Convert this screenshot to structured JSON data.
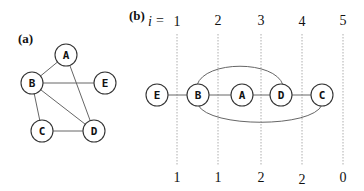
{
  "panel_a": {
    "label": "(a)",
    "nodes": [
      {
        "id": "A",
        "label": "A"
      },
      {
        "id": "B",
        "label": "B"
      },
      {
        "id": "E",
        "label": "E"
      },
      {
        "id": "C",
        "label": "C"
      },
      {
        "id": "D",
        "label": "D"
      }
    ],
    "edges": [
      [
        "A",
        "B"
      ],
      [
        "A",
        "D"
      ],
      [
        "B",
        "E"
      ],
      [
        "B",
        "C"
      ],
      [
        "B",
        "D"
      ],
      [
        "C",
        "D"
      ]
    ]
  },
  "panel_b": {
    "label": "(b)",
    "index_var": "i",
    "index_eq": "=",
    "top_indices": [
      "1",
      "2",
      "3",
      "4",
      "5"
    ],
    "bottom_values": [
      "1",
      "1",
      "2",
      "2",
      "0"
    ],
    "ordering": [
      {
        "id": "E",
        "label": "E"
      },
      {
        "id": "B",
        "label": "B"
      },
      {
        "id": "A",
        "label": "A"
      },
      {
        "id": "D",
        "label": "D"
      },
      {
        "id": "C",
        "label": "C"
      }
    ],
    "edges": [
      [
        "E",
        "B"
      ],
      [
        "B",
        "A"
      ],
      [
        "A",
        "D"
      ],
      [
        "D",
        "C"
      ],
      [
        "B",
        "D"
      ],
      [
        "B",
        "C"
      ]
    ]
  }
}
